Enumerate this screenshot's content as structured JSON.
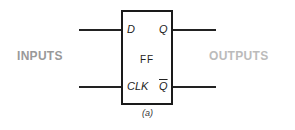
{
  "diagram": {
    "block_label": "FF",
    "inputs_label": "INPUTS",
    "outputs_label": "OUTPUTS",
    "pins": {
      "d": "D",
      "clk": "CLK",
      "q": "Q",
      "q_bar": "Q"
    },
    "caption": "(a)",
    "colors": {
      "inputs_label": "#999999",
      "outputs_label": "#bbbbbb",
      "lines": "#1a1a1a"
    }
  }
}
